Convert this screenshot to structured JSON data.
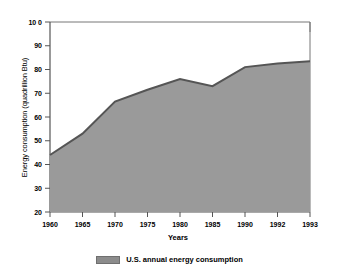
{
  "chart_data": {
    "type": "area",
    "title": "",
    "xlabel": "Years",
    "ylabel": "Energy consumption (quadrillion Btu)",
    "categories": [
      "1960",
      "1965",
      "1970",
      "1975",
      "1980",
      "1985",
      "1990",
      "1992",
      "1993"
    ],
    "x_positions": [
      1960,
      1965,
      1970,
      1975,
      1980,
      1985,
      1990,
      1992,
      1993
    ],
    "values": [
      44,
      53,
      66.5,
      71.5,
      76,
      73,
      81,
      82.5,
      83.5
    ],
    "series": [
      {
        "name": "U.S. annual energy consumption",
        "values": [
          44,
          53,
          66.5,
          71.5,
          76,
          73,
          81,
          82.5,
          83.5
        ]
      }
    ],
    "ylim": [
      20,
      100
    ],
    "y_ticks": [
      20,
      30,
      40,
      50,
      60,
      70,
      80,
      90,
      100
    ],
    "y_tick_labels": [
      "20",
      "30",
      "40",
      "50",
      "60",
      "70",
      "80",
      "90",
      "10 0"
    ],
    "grid": false,
    "legend_position": "bottom",
    "fill_color": "#9a9a9a",
    "line_color": "#555555",
    "axis_color": "#666666",
    "background_color": "#ffffff"
  },
  "legend": {
    "entries": [
      {
        "label": "U.S. annual energy consumption",
        "color": "#8c8c8c"
      }
    ]
  },
  "axes": {
    "x_title": "Years",
    "y_title": "Energy consumption (quadrillion Btu)"
  },
  "title_fragment": ""
}
